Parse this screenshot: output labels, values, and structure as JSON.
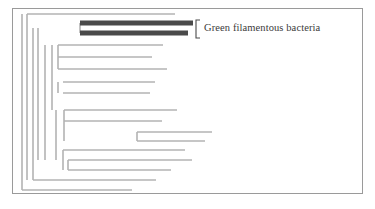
{
  "figure": {
    "type": "phylogenetic-cladogram",
    "title": "",
    "frame": {
      "border_color": "#9a9a9a",
      "background": "#ffffff",
      "x": 12,
      "y": 8,
      "width": 351,
      "height": 186
    },
    "colors": {
      "branch": "#b3b3b3",
      "highlight_bar": "#4a4a4a",
      "bracket": "#4a4a4a",
      "label_text": "#3a3a3a",
      "frame_border": "#9a9a9a",
      "background": "#ffffff"
    },
    "annotations": [
      {
        "name": "green-filamentous-bacteria-group",
        "label": "Green filamentous bacteria",
        "bracket": {
          "x": 196,
          "y_top": 20,
          "y_bottom": 38,
          "tick": 4
        },
        "highlighted_branch_count": 2
      }
    ],
    "highlight_bars": [
      {
        "name": "highlighted-branch-1",
        "x1": 80,
        "x2": 193,
        "y": 23,
        "thickness": 5
      },
      {
        "name": "highlighted-branch-2",
        "x1": 80,
        "x2": 188,
        "y": 33,
        "thickness": 5
      }
    ],
    "branches": [
      {
        "name": "tip-1",
        "x1": 27,
        "x2": 175,
        "y": 14
      },
      {
        "name": "tip-2",
        "x1": 58,
        "x2": 163,
        "y": 45
      },
      {
        "name": "tip-3",
        "x1": 58,
        "x2": 152,
        "y": 57
      },
      {
        "name": "tip-4",
        "x1": 58,
        "x2": 167,
        "y": 69
      },
      {
        "name": "tip-5",
        "x1": 63,
        "x2": 155,
        "y": 82
      },
      {
        "name": "tip-6",
        "x1": 63,
        "x2": 150,
        "y": 93
      },
      {
        "name": "tip-7",
        "x1": 64,
        "x2": 177,
        "y": 110
      },
      {
        "name": "tip-8",
        "x1": 64,
        "x2": 162,
        "y": 121
      },
      {
        "name": "tip-9",
        "x1": 137,
        "x2": 212,
        "y": 132
      },
      {
        "name": "tip-10",
        "x1": 137,
        "x2": 205,
        "y": 141
      },
      {
        "name": "tip-11",
        "x1": 63,
        "x2": 185,
        "y": 150
      },
      {
        "name": "tip-12",
        "x1": 68,
        "x2": 192,
        "y": 160
      },
      {
        "name": "tip-13",
        "x1": 68,
        "x2": 171,
        "y": 170
      },
      {
        "name": "tip-14",
        "x1": 33,
        "x2": 156,
        "y": 180
      },
      {
        "name": "tip-15",
        "x1": 22,
        "x2": 132,
        "y": 190
      }
    ],
    "connectors": [
      {
        "name": "root-vertical",
        "x": 22,
        "y1": 14,
        "y2": 190
      },
      {
        "name": "internal-vertical-a",
        "x": 27,
        "y1": 14,
        "y2": 180
      },
      {
        "name": "internal-vertical-b",
        "x": 33,
        "y1": 28,
        "y2": 180
      },
      {
        "name": "clade-stem-green",
        "x": 38,
        "y1": 28,
        "y2": 160
      },
      {
        "name": "internal-vertical-c",
        "x": 45,
        "y1": 45,
        "y2": 160
      },
      {
        "name": "internal-vertical-d",
        "x": 52,
        "y1": 45,
        "y2": 110
      },
      {
        "name": "internal-vertical-e",
        "x": 58,
        "y1": 45,
        "y2": 69
      },
      {
        "name": "internal-vertical-f",
        "x": 58,
        "y1": 82,
        "y2": 93
      },
      {
        "name": "internal-vertical-g",
        "x": 56,
        "y1": 110,
        "y2": 160
      },
      {
        "name": "internal-vertical-h",
        "x": 64,
        "y1": 110,
        "y2": 141
      },
      {
        "name": "internal-vertical-i",
        "x": 137,
        "y1": 132,
        "y2": 141
      },
      {
        "name": "internal-vertical-j",
        "x": 63,
        "y1": 150,
        "y2": 170
      },
      {
        "name": "internal-vertical-k",
        "x": 68,
        "y1": 160,
        "y2": 170
      },
      {
        "name": "green-clade-vertical",
        "x": 80,
        "y1": 23,
        "y2": 33
      }
    ]
  }
}
